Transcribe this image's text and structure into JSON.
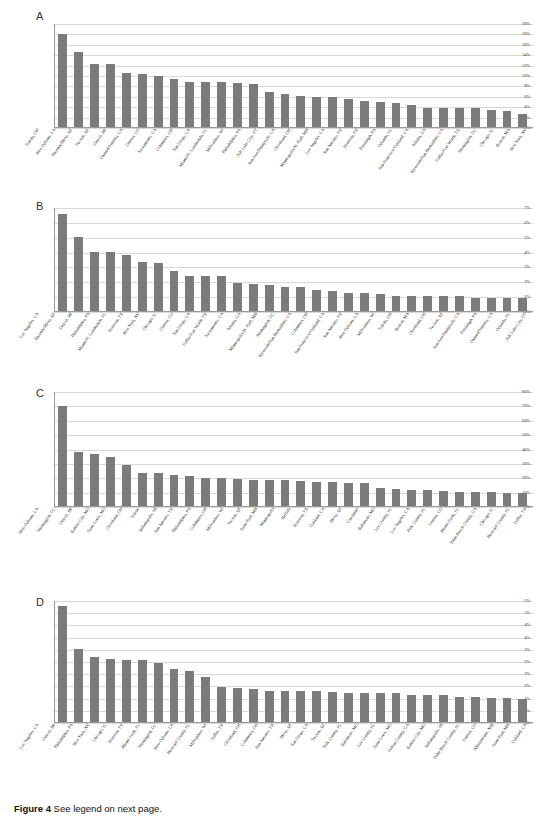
{
  "figure": {
    "caption_bold": "Figure 4",
    "caption_text": "See legend on next page."
  },
  "panels": [
    {
      "letter": "A",
      "yticks": [
        "0%",
        "2%",
        "4%",
        "6%",
        "8%",
        "10%",
        "12%",
        "14%",
        "16%",
        "18%",
        "20%"
      ],
      "ymax": 20,
      "categories": [
        "Toledo, OH",
        "New Orleans, LA",
        "Phoenix/Mesa, AZ",
        "Tucson, AZ",
        "Detroit, MI",
        "Oxnard/Ventura, CA",
        "Denver, CO",
        "Sacramento, CA",
        "Columbus, OH",
        "San Diego, CA",
        "Miami/Ft. Lauderdale, FL",
        "Milwaukee, WI",
        "Philadelphia, PA",
        "Salt Lake City, UT",
        "San Jose/Sunnyvale, CA",
        "Cleveland, OH",
        "Minneapolis/St. Paul, MN",
        "Los Angeles, CA",
        "San Antonio, TX",
        "Houston, TX",
        "Pittsburgh, PA",
        "Orlando, FL",
        "San Francisco/Oakland, CA",
        "Atlanta, GA",
        "Riverside/San Bernardino, CA",
        "Dallas/Fort Worth, TX",
        "Washington, DC",
        "Chicago, IL",
        "Boston, MA",
        "New York, NY"
      ],
      "values": [
        18.1,
        14.6,
        12.3,
        12.3,
        10.5,
        10.2,
        10.0,
        9.4,
        8.8,
        8.8,
        8.8,
        8.6,
        8.4,
        6.8,
        6.4,
        6.0,
        5.9,
        5.8,
        5.4,
        5.0,
        4.9,
        4.6,
        4.3,
        3.6,
        3.6,
        3.6,
        3.6,
        3.3,
        3.1,
        2.6
      ]
    },
    {
      "letter": "B",
      "yticks": [
        "0%",
        "1%",
        "2%",
        "3%",
        "4%",
        "5%",
        "6%",
        "7%"
      ],
      "ymax": 7,
      "categories": [
        "Los Angeles, CA",
        "Phoenix/Mesa, AZ",
        "Detroit, MI",
        "Philadelphia, PA",
        "Miami/Ft. Lauderdale, FL",
        "Houston, TX",
        "New York, NY",
        "Chicago, IL",
        "Denver, CO",
        "San Diego, CA",
        "Dallas/Fort Worth, TX",
        "Sacramento, CA",
        "Atlanta, GA",
        "Minneapolis/St. Paul, MN",
        "Washington, DC",
        "Riverside/San Bernardino, CA",
        "Columbus, OH",
        "San Francisco/Oakland, CA",
        "San Antonio, TX",
        "New Orleans, LA",
        "Milwaukee, WI",
        "Toledo, OH",
        "Boston, MA",
        "Cleveland, OH",
        "Tucson, AZ",
        "San Jose/Sunnyvale, CA",
        "Pittsburgh, PA",
        "Oxnard/Ventura, CA",
        "Orlando, FL",
        "Salt Lake City, UT"
      ],
      "values": [
        6.6,
        5.0,
        4.0,
        4.0,
        3.8,
        3.3,
        3.25,
        2.7,
        2.4,
        2.4,
        2.4,
        1.9,
        1.85,
        1.8,
        1.6,
        1.6,
        1.45,
        1.35,
        1.25,
        1.2,
        1.15,
        1.05,
        1.05,
        1.05,
        1.05,
        1.0,
        0.9,
        0.9,
        0.9,
        0.9
      ]
    },
    {
      "letter": "C",
      "yticks": [
        "0%",
        "10%",
        "20%",
        "30%",
        "40%",
        "50%",
        "60%",
        "70%",
        "80%"
      ],
      "ymax": 80,
      "categories": [
        "New Orleans, LA",
        "Washington, DC",
        "Detroit, MI",
        "Kansas City, MO",
        "Saint Louis, MO",
        "Cleveland, OH",
        "Toledo",
        "Indianapolis, IN",
        "San Antonio, TX",
        "Philadelphia, PA",
        "Columbus, OH",
        "Milwaukee, WI",
        "Tucson, AZ",
        "Saint Paul, MN",
        "Minneapolis",
        "Buffalo",
        "Houston, TX",
        "Oakland, CA",
        "Mesa, AZ",
        "Cincinnati",
        "Baltimore, MD",
        "Lee County, FL",
        "Los Angeles, CA",
        "Polk County, FL",
        "Denver, CO",
        "Miami-Dade, FL",
        "Palm Beach County, GA",
        "Chicago, IL",
        "Broward County, FL",
        "Dallas, TX"
      ],
      "values": [
        70.0,
        38.0,
        36.5,
        34.5,
        29.0,
        23.0,
        23.0,
        22.0,
        21.0,
        20.0,
        20.0,
        19.0,
        18.0,
        18.0,
        18.0,
        17.5,
        17.0,
        17.0,
        16.0,
        16.0,
        12.5,
        12.0,
        11.5,
        11.0,
        10.5,
        10.0,
        10.0,
        9.5,
        9.0,
        9.0
      ]
    },
    {
      "letter": "D",
      "yticks": [
        "0%",
        "1%",
        "1%",
        "2%",
        "2%",
        "3%",
        "3%",
        "4%",
        "4%",
        "5%",
        "5%"
      ],
      "ymax": 5,
      "categories": [
        "Los Angeles, CA",
        "Detroit, MI",
        "Philadelphia, PA",
        "New York, NY",
        "Chicago, IL",
        "Houston, TX",
        "Miami-Dade, FL",
        "Washington, DC",
        "New Orleans, LA",
        "Broward County, FL",
        "Milwaukee, WI",
        "Dallas, TX",
        "Cleveland, OH",
        "Columbus, OH",
        "San Antonio, TX",
        "Mesa, AZ",
        "San Diego, CA",
        "Tucson, AZ",
        "Polk County, FL",
        "Baltimore, MD",
        "Lee County, FL",
        "Saint Louis, MO",
        "Fulton County, GA",
        "Kansas City, MO",
        "Indianapolis, IN",
        "Palm Beach County, FL",
        "Denver, CO",
        "Albuquerque, NM",
        "Saint Paul, MN",
        "Oakland, CA"
      ],
      "values": [
        4.8,
        3.0,
        2.7,
        2.6,
        2.55,
        2.55,
        2.45,
        2.2,
        2.1,
        1.85,
        1.45,
        1.4,
        1.35,
        1.3,
        1.3,
        1.3,
        1.3,
        1.25,
        1.2,
        1.2,
        1.2,
        1.2,
        1.1,
        1.1,
        1.1,
        1.05,
        1.05,
        1.0,
        1.0,
        0.95
      ]
    }
  ],
  "colors": {
    "bar": "#7b7b7b",
    "gridline": "#d9d9d9",
    "axis": "#9a9a9a"
  }
}
